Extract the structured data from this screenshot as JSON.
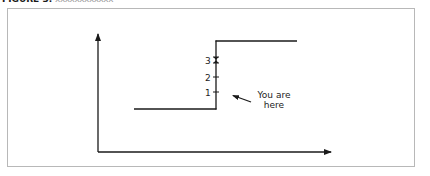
{
  "caption": {
    "label": "FIGURE 3.",
    "rest": "xxxxxxxxxxxx"
  },
  "diagram": {
    "type": "step-function",
    "tick_labels": [
      "1",
      "2",
      "3"
    ],
    "annotation": {
      "line1": "You are",
      "line2": "here"
    },
    "colors": {
      "line": "#1a1a1a",
      "frame": "#b8b8b8"
    }
  }
}
